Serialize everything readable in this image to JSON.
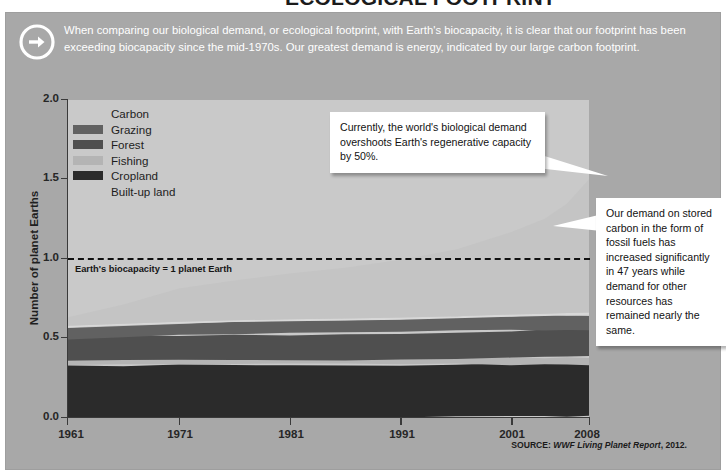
{
  "page": {
    "cut_title": "ECOLOGICAL FOOTPRINT",
    "intro_icon": "arrow-right-circle-icon",
    "intro_text": "When comparing our biological demand, or ecological footprint, with Earth's biocapacity, it is clear that our footprint has been exceeding biocapacity since the mid-1970s. Our greatest demand is energy, indicated by our large carbon footprint.",
    "source_prefix": "SOURCE: ",
    "source_italic": "WWF Living Planet Report",
    "source_suffix": ", 2012."
  },
  "annotations": {
    "biocapacity_label": "Earth's biocapacity = 1 planet Earth",
    "callout_1": "Currently, the world's biological demand overshoots Earth's regenerative capacity by 50%.",
    "callout_2": "Our demand on stored carbon in the form of fossil fuels has increased significantly in 47 years while demand for other resources has remained nearly the same."
  },
  "colors": {
    "panel_bg": "#a8a8a8",
    "plot_bg": "#c9c9c9",
    "carbon": "#c4c4c4",
    "grazing": "#616161",
    "forest": "#4f4f4f",
    "fishing": "#b4b4b4",
    "cropland": "#2b2b2b",
    "builtup": "#d8d8d8",
    "axis": "#3a3a3a",
    "intro_text": "#ffffff",
    "callout_bg": "#ffffff"
  },
  "chart_data": {
    "type": "area",
    "stacked": true,
    "title": "Ecological Footprint",
    "xlabel": "",
    "ylabel": "Number of planet Earths",
    "xlim": [
      1961,
      2008
    ],
    "ylim": [
      0.0,
      2.0
    ],
    "grid": false,
    "legend_position": "top-left",
    "xticks": [
      1961,
      1971,
      1981,
      1991,
      2001,
      2008
    ],
    "yticks": [
      "0.0",
      "0.5",
      "1.0",
      "1.5",
      "2.0"
    ],
    "reference_line": {
      "value": 1.0,
      "label": "Earth's biocapacity = 1 planet Earth",
      "style": "dashed"
    },
    "x": [
      1961,
      1966,
      1971,
      1976,
      1981,
      1986,
      1991,
      1996,
      2001,
      2004,
      2006,
      2008
    ],
    "series": [
      {
        "name": "Cropland",
        "color": "#2b2b2b",
        "values": [
          0.325,
          0.33,
          0.332,
          0.333,
          0.33,
          0.33,
          0.33,
          0.332,
          0.333,
          0.333,
          0.334,
          0.335
        ]
      },
      {
        "name": "Fishing",
        "color": "#b4b4b4",
        "values": [
          0.028,
          0.03,
          0.032,
          0.034,
          0.036,
          0.037,
          0.038,
          0.04,
          0.042,
          0.043,
          0.043,
          0.044
        ]
      },
      {
        "name": "Forest",
        "color": "#4f4f4f",
        "values": [
          0.14,
          0.145,
          0.15,
          0.155,
          0.158,
          0.16,
          0.162,
          0.165,
          0.17,
          0.172,
          0.174,
          0.176
        ]
      },
      {
        "name": "Grazing",
        "color": "#616161",
        "values": [
          0.072,
          0.074,
          0.076,
          0.078,
          0.08,
          0.082,
          0.084,
          0.086,
          0.088,
          0.089,
          0.09,
          0.09
        ]
      },
      {
        "name": "Built-up land",
        "color": "#d8d8d8",
        "values": [
          0.01,
          0.01,
          0.011,
          0.011,
          0.012,
          0.012,
          0.013,
          0.013,
          0.014,
          0.014,
          0.015,
          0.015
        ]
      },
      {
        "name": "Carbon",
        "color": "#c4c4c4",
        "values": [
          0.055,
          0.12,
          0.21,
          0.25,
          0.29,
          0.32,
          0.365,
          0.42,
          0.52,
          0.6,
          0.69,
          0.84
        ]
      }
    ],
    "total_footprint": [
      0.63,
      0.71,
      0.81,
      0.86,
      0.91,
      0.94,
      0.99,
      1.06,
      1.17,
      1.25,
      1.35,
      1.5
    ],
    "legend_order": [
      "Carbon",
      "Grazing",
      "Forest",
      "Fishing",
      "Cropland",
      "Built-up land"
    ]
  },
  "legend": [
    {
      "label": "Carbon",
      "swatch": "#c4c4c4"
    },
    {
      "label": "Grazing",
      "swatch": "#616161"
    },
    {
      "label": "Forest",
      "swatch": "#4f4f4f"
    },
    {
      "label": "Fishing",
      "swatch": "#b4b4b4"
    },
    {
      "label": "Cropland",
      "swatch": "#2b2b2b"
    },
    {
      "label": "Built-up land",
      "swatch": "#d8d8d8"
    }
  ]
}
